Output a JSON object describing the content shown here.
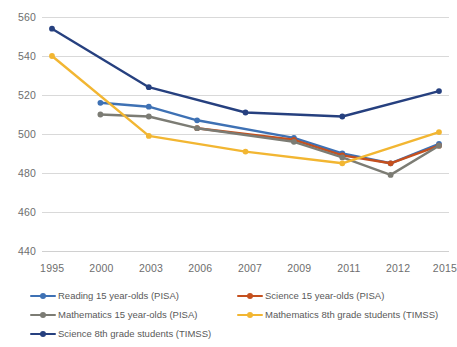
{
  "chart_data": {
    "type": "line",
    "title": "",
    "subtitle": "",
    "xlabel": "",
    "ylabel": "",
    "x": [
      "1995",
      "2000",
      "2003",
      "2006",
      "2007",
      "2009",
      "2011",
      "2012",
      "2015"
    ],
    "ylim": [
      440,
      560
    ],
    "yticks": [
      440,
      460,
      480,
      500,
      520,
      540,
      560
    ],
    "grid": true,
    "legend_position": "bottom",
    "series": [
      {
        "name": "Reading 15 year-olds (PISA)",
        "color": "#3E71B4",
        "values": [
          null,
          516,
          514,
          507,
          null,
          498,
          490,
          485,
          495
        ]
      },
      {
        "name": "Science 15 year-olds (PISA)",
        "color": "#C5501E",
        "values": [
          null,
          null,
          null,
          503,
          null,
          497,
          489,
          485,
          494
        ]
      },
      {
        "name": "Mathematics 15 year-olds (PISA)",
        "color": "#7C7C74",
        "values": [
          null,
          510,
          509,
          503,
          null,
          496,
          488,
          479,
          494
        ]
      },
      {
        "name": "Mathematics 8th grade students (TIMSS)",
        "color": "#F2B632",
        "values": [
          540,
          null,
          499,
          null,
          491,
          null,
          485,
          null,
          501
        ]
      },
      {
        "name": "Science 8th grade students (TIMSS)",
        "color": "#26407F",
        "values": [
          554,
          null,
          524,
          null,
          511,
          null,
          509,
          null,
          522
        ]
      }
    ]
  },
  "legend": {
    "items": [
      {
        "label": "Reading 15 year-olds (PISA)"
      },
      {
        "label": "Science 15 year-olds (PISA)"
      },
      {
        "label": "Mathematics 15 year-olds (PISA)"
      },
      {
        "label": "Mathematics 8th grade students (TIMSS)"
      },
      {
        "label": "Science 8th grade students (TIMSS)"
      }
    ]
  },
  "axes": {
    "y_tick_labels": [
      "560",
      "540",
      "520",
      "500",
      "480",
      "460",
      "440"
    ],
    "x_tick_labels": [
      "1995",
      "2000",
      "2003",
      "2006",
      "2007",
      "2009",
      "2011",
      "2012",
      "2015"
    ]
  }
}
